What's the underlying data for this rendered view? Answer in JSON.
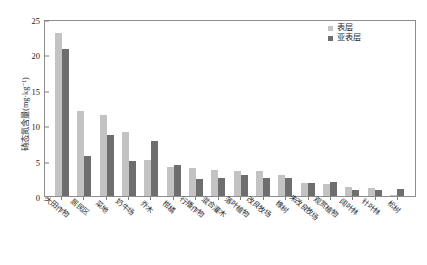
{
  "chart_data": {
    "type": "bar",
    "title": "",
    "xlabel": "",
    "ylabel": "硝态氮含量(mg·kg⁻¹)",
    "ylim": [
      0,
      25
    ],
    "yticks": [
      0,
      5,
      10,
      15,
      20,
      25
    ],
    "grid": false,
    "legend_position": "top-right",
    "categories": [
      "大田作物",
      "居民区",
      "菜地",
      "奶牛场",
      "乔木",
      "柑橘",
      "行播作物",
      "混合灌木",
      "落叶植物",
      "改良牧场",
      "橡树",
      "未改良牧场",
      "观赏植物",
      "阔叶林",
      "针叶林",
      "松树"
    ],
    "series": [
      {
        "name": "表层",
        "color": "#c3c3c3",
        "values": [
          23.0,
          12.0,
          11.4,
          9.0,
          5.1,
          4.1,
          3.9,
          3.7,
          3.6,
          3.6,
          2.9,
          1.8,
          1.7,
          1.3,
          1.2,
          0.2
        ]
      },
      {
        "name": "亚表层",
        "color": "#6e6e6e",
        "values": [
          20.8,
          5.6,
          8.6,
          4.9,
          7.8,
          4.4,
          2.4,
          2.6,
          2.9,
          2.5,
          2.6,
          1.8,
          2.0,
          0.9,
          0.8,
          1.0
        ]
      }
    ]
  },
  "legend": {
    "items": [
      {
        "label": "表层",
        "color": "#c3c3c3"
      },
      {
        "label": "亚表层",
        "color": "#6e6e6e"
      }
    ]
  },
  "colors": {
    "surface": "#c3c3c3",
    "subsurface": "#6e6e6e",
    "axis": "#8d8d8d",
    "text": "#2a2a2a",
    "background": "#ffffff"
  }
}
